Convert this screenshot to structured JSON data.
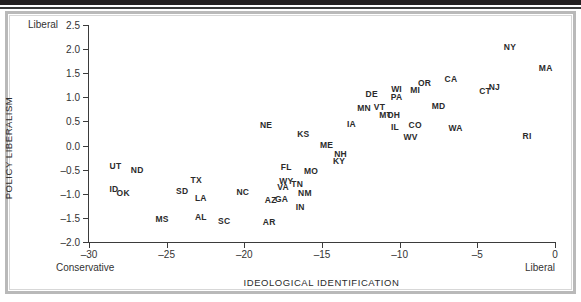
{
  "figure": {
    "x_axis_title": "IDEOLOGICAL IDENTIFICATION",
    "y_axis_title": "POLICY LIBERALISM",
    "corner_liberal_top": "Liberal",
    "corner_conservative": "Conservative",
    "corner_liberal_right": "Liberal"
  },
  "chart_data": {
    "type": "scatter",
    "title": "",
    "xlabel": "IDEOLOGICAL IDENTIFICATION",
    "ylabel": "POLICY LIBERALISM",
    "xlim": [
      -30,
      0
    ],
    "ylim": [
      -2.0,
      2.5
    ],
    "xticks": [
      -30,
      -25,
      -20,
      -15,
      -10,
      -5,
      0
    ],
    "xticklabels": [
      "–30",
      "–25",
      "–20",
      "–15",
      "–10",
      "–5",
      "0"
    ],
    "yticks": [
      -2.0,
      -1.5,
      -1.0,
      -0.5,
      0.0,
      0.5,
      1.0,
      1.5,
      2.0,
      2.5
    ],
    "yticklabels": [
      "–2.0",
      "–1.5",
      "–1.0",
      "–0.5",
      "0.0",
      "0.5",
      "1.0",
      "1.5",
      "2.0",
      "2.5"
    ],
    "grid": false,
    "legend": null,
    "marker_style": "text-label",
    "annotations": [
      {
        "text": "Liberal",
        "position": "top-left-of-y-axis"
      },
      {
        "text": "Conservative",
        "position": "bottom-left-of-x-axis"
      },
      {
        "text": "Liberal",
        "position": "bottom-right-of-x-axis"
      }
    ],
    "points": [
      {
        "label": "UT",
        "x": -28.3,
        "y": -0.42
      },
      {
        "label": "ND",
        "x": -26.9,
        "y": -0.5
      },
      {
        "label": "ID",
        "x": -28.4,
        "y": -0.9
      },
      {
        "label": "OK",
        "x": -27.8,
        "y": -0.99
      },
      {
        "label": "MS",
        "x": -25.3,
        "y": -1.52
      },
      {
        "label": "SD",
        "x": -24.0,
        "y": -0.95
      },
      {
        "label": "TX",
        "x": -23.1,
        "y": -0.72
      },
      {
        "label": "LA",
        "x": -22.8,
        "y": -1.09
      },
      {
        "label": "AL",
        "x": -22.8,
        "y": -1.48
      },
      {
        "label": "SC",
        "x": -21.3,
        "y": -1.57
      },
      {
        "label": "NC",
        "x": -20.1,
        "y": -0.97
      },
      {
        "label": "AR",
        "x": -18.4,
        "y": -1.58
      },
      {
        "label": "NE",
        "x": -18.6,
        "y": 0.42
      },
      {
        "label": "AZ",
        "x": -18.3,
        "y": -1.12
      },
      {
        "label": "VA",
        "x": -17.5,
        "y": -0.86
      },
      {
        "label": "WY",
        "x": -17.3,
        "y": -0.73
      },
      {
        "label": "GA",
        "x": -17.6,
        "y": -1.1
      },
      {
        "label": "FL",
        "x": -17.3,
        "y": -0.45
      },
      {
        "label": "TN",
        "x": -16.6,
        "y": -0.8
      },
      {
        "label": "IN",
        "x": -16.4,
        "y": -1.28
      },
      {
        "label": "NM",
        "x": -16.1,
        "y": -0.99
      },
      {
        "label": "KS",
        "x": -16.2,
        "y": 0.25
      },
      {
        "label": "MO",
        "x": -15.7,
        "y": -0.53
      },
      {
        "label": "ME",
        "x": -14.7,
        "y": 0.02
      },
      {
        "label": "KY",
        "x": -13.9,
        "y": -0.31
      },
      {
        "label": "NH",
        "x": -13.8,
        "y": -0.18
      },
      {
        "label": "IA",
        "x": -13.1,
        "y": 0.44
      },
      {
        "label": "MN",
        "x": -12.3,
        "y": 0.77
      },
      {
        "label": "DE",
        "x": -11.8,
        "y": 1.07
      },
      {
        "label": "VT",
        "x": -11.3,
        "y": 0.79
      },
      {
        "label": "MT",
        "x": -10.9,
        "y": 0.63
      },
      {
        "label": "OH",
        "x": -10.4,
        "y": 0.64
      },
      {
        "label": "WI",
        "x": -10.2,
        "y": 1.18
      },
      {
        "label": "PA",
        "x": -10.2,
        "y": 1.01
      },
      {
        "label": "IL",
        "x": -10.3,
        "y": 0.38
      },
      {
        "label": "WV",
        "x": -9.3,
        "y": 0.17
      },
      {
        "label": "CO",
        "x": -9.0,
        "y": 0.42
      },
      {
        "label": "MI",
        "x": -9.0,
        "y": 1.16
      },
      {
        "label": "OR",
        "x": -8.4,
        "y": 1.29
      },
      {
        "label": "MD",
        "x": -7.5,
        "y": 0.83
      },
      {
        "label": "CA",
        "x": -6.7,
        "y": 1.38
      },
      {
        "label": "WA",
        "x": -6.4,
        "y": 0.36
      },
      {
        "label": "CT",
        "x": -4.5,
        "y": 1.13
      },
      {
        "label": "NJ",
        "x": -3.9,
        "y": 1.22
      },
      {
        "label": "NY",
        "x": -2.9,
        "y": 2.04
      },
      {
        "label": "RI",
        "x": -1.8,
        "y": 0.2
      },
      {
        "label": "MA",
        "x": -0.6,
        "y": 1.6
      }
    ]
  }
}
